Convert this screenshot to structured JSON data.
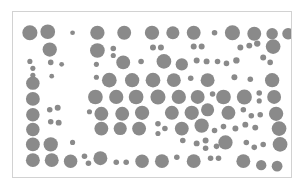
{
  "chart_data": {
    "type": "scatter",
    "title": "",
    "subtitle": "",
    "xlabel": "",
    "ylabel": "",
    "xlim": [
      0,
      280
    ],
    "ylim": [
      0,
      167
    ],
    "grid": false,
    "legend": null,
    "annotations": [],
    "xticklabels": [],
    "yticklabels": [],
    "marker": "circle",
    "marker_color": "#8a8a8a",
    "background_color": "#ffffff",
    "frame_color": "#d2d2d2",
    "size_encoding": "radius",
    "series": [
      {
        "name": "bubbles",
        "color": "#8a8a8a",
        "points": [
          {
            "x": 17,
            "y": 21,
            "r": 7.6
          },
          {
            "x": 35,
            "y": 20,
            "r": 7.4
          },
          {
            "x": 60,
            "y": 21,
            "r": 2.4
          },
          {
            "x": 85,
            "y": 21,
            "r": 7.2
          },
          {
            "x": 112,
            "y": 21,
            "r": 7.0
          },
          {
            "x": 140,
            "y": 21,
            "r": 7.2
          },
          {
            "x": 161,
            "y": 21,
            "r": 6.6
          },
          {
            "x": 182,
            "y": 21,
            "r": 7.0
          },
          {
            "x": 203,
            "y": 21,
            "r": 2.8
          },
          {
            "x": 221,
            "y": 21,
            "r": 7.6
          },
          {
            "x": 243,
            "y": 22,
            "r": 7.0
          },
          {
            "x": 261,
            "y": 22,
            "r": 5.8
          },
          {
            "x": 277,
            "y": 22,
            "r": 5.8
          },
          {
            "x": 37,
            "y": 38,
            "r": 7.2
          },
          {
            "x": 85,
            "y": 39,
            "r": 7.4
          },
          {
            "x": 101,
            "y": 37,
            "r": 2.8
          },
          {
            "x": 101,
            "y": 44,
            "r": 2.6
          },
          {
            "x": 141,
            "y": 36,
            "r": 3.0
          },
          {
            "x": 149,
            "y": 36,
            "r": 3.0
          },
          {
            "x": 182,
            "y": 35,
            "r": 3.0
          },
          {
            "x": 190,
            "y": 35,
            "r": 3.0
          },
          {
            "x": 229,
            "y": 36,
            "r": 3.0
          },
          {
            "x": 238,
            "y": 34,
            "r": 3.0
          },
          {
            "x": 246,
            "y": 32,
            "r": 3.2
          },
          {
            "x": 262,
            "y": 35,
            "r": 7.4
          },
          {
            "x": 17,
            "y": 50,
            "r": 2.6
          },
          {
            "x": 20,
            "y": 57,
            "r": 2.6
          },
          {
            "x": 20,
            "y": 64,
            "r": 2.6
          },
          {
            "x": 38,
            "y": 51,
            "r": 2.8
          },
          {
            "x": 49,
            "y": 53,
            "r": 2.4
          },
          {
            "x": 84,
            "y": 53,
            "r": 2.6
          },
          {
            "x": 111,
            "y": 51,
            "r": 7.0
          },
          {
            "x": 129,
            "y": 50,
            "r": 2.8
          },
          {
            "x": 152,
            "y": 50,
            "r": 7.4
          },
          {
            "x": 170,
            "y": 53,
            "r": 6.2
          },
          {
            "x": 185,
            "y": 49,
            "r": 3.0
          },
          {
            "x": 195,
            "y": 50,
            "r": 3.0
          },
          {
            "x": 206,
            "y": 50,
            "r": 2.8
          },
          {
            "x": 215,
            "y": 52,
            "r": 2.8
          },
          {
            "x": 225,
            "y": 49,
            "r": 3.2
          },
          {
            "x": 252,
            "y": 46,
            "r": 3.0
          },
          {
            "x": 259,
            "y": 51,
            "r": 2.8
          },
          {
            "x": 20,
            "y": 72,
            "r": 6.8
          },
          {
            "x": 39,
            "y": 65,
            "r": 2.4
          },
          {
            "x": 84,
            "y": 66,
            "r": 2.6
          },
          {
            "x": 97,
            "y": 69,
            "r": 7.4
          },
          {
            "x": 120,
            "y": 69,
            "r": 7.2
          },
          {
            "x": 141,
            "y": 69,
            "r": 7.4
          },
          {
            "x": 162,
            "y": 69,
            "r": 7.0
          },
          {
            "x": 179,
            "y": 67,
            "r": 2.8
          },
          {
            "x": 196,
            "y": 69,
            "r": 7.0
          },
          {
            "x": 223,
            "y": 66,
            "r": 3.0
          },
          {
            "x": 239,
            "y": 68,
            "r": 2.8
          },
          {
            "x": 261,
            "y": 69,
            "r": 7.2
          },
          {
            "x": 20,
            "y": 88,
            "r": 7.0
          },
          {
            "x": 83,
            "y": 86,
            "r": 7.4
          },
          {
            "x": 104,
            "y": 86,
            "r": 7.2
          },
          {
            "x": 124,
            "y": 86,
            "r": 7.4
          },
          {
            "x": 146,
            "y": 86,
            "r": 7.6
          },
          {
            "x": 167,
            "y": 86,
            "r": 7.2
          },
          {
            "x": 186,
            "y": 86,
            "r": 7.0
          },
          {
            "x": 201,
            "y": 83,
            "r": 2.8
          },
          {
            "x": 212,
            "y": 86,
            "r": 7.4
          },
          {
            "x": 233,
            "y": 86,
            "r": 7.6
          },
          {
            "x": 248,
            "y": 82,
            "r": 2.8
          },
          {
            "x": 248,
            "y": 90,
            "r": 2.6
          },
          {
            "x": 263,
            "y": 86,
            "r": 7.0
          },
          {
            "x": 20,
            "y": 104,
            "r": 6.8
          },
          {
            "x": 37,
            "y": 99,
            "r": 2.8
          },
          {
            "x": 45,
            "y": 97,
            "r": 3.0
          },
          {
            "x": 77,
            "y": 101,
            "r": 2.6
          },
          {
            "x": 89,
            "y": 103,
            "r": 7.0
          },
          {
            "x": 110,
            "y": 103,
            "r": 7.0
          },
          {
            "x": 130,
            "y": 102,
            "r": 7.2
          },
          {
            "x": 160,
            "y": 102,
            "r": 7.0
          },
          {
            "x": 180,
            "y": 102,
            "r": 7.2
          },
          {
            "x": 196,
            "y": 99,
            "r": 6.6
          },
          {
            "x": 217,
            "y": 102,
            "r": 7.0
          },
          {
            "x": 232,
            "y": 99,
            "r": 2.8
          },
          {
            "x": 240,
            "y": 105,
            "r": 2.8
          },
          {
            "x": 249,
            "y": 104,
            "r": 2.8
          },
          {
            "x": 265,
            "y": 103,
            "r": 7.2
          },
          {
            "x": 20,
            "y": 119,
            "r": 6.8
          },
          {
            "x": 38,
            "y": 111,
            "r": 2.8
          },
          {
            "x": 46,
            "y": 112,
            "r": 3.0
          },
          {
            "x": 89,
            "y": 118,
            "r": 7.0
          },
          {
            "x": 108,
            "y": 118,
            "r": 6.6
          },
          {
            "x": 127,
            "y": 118,
            "r": 7.0
          },
          {
            "x": 146,
            "y": 113,
            "r": 2.8
          },
          {
            "x": 153,
            "y": 118,
            "r": 2.8
          },
          {
            "x": 146,
            "y": 123,
            "r": 2.6
          },
          {
            "x": 170,
            "y": 118,
            "r": 7.0
          },
          {
            "x": 190,
            "y": 115,
            "r": 7.2
          },
          {
            "x": 203,
            "y": 120,
            "r": 2.8
          },
          {
            "x": 212,
            "y": 116,
            "r": 2.8
          },
          {
            "x": 224,
            "y": 118,
            "r": 3.0
          },
          {
            "x": 234,
            "y": 114,
            "r": 3.0
          },
          {
            "x": 244,
            "y": 117,
            "r": 3.0
          },
          {
            "x": 268,
            "y": 118,
            "r": 7.4
          },
          {
            "x": 20,
            "y": 134,
            "r": 7.0
          },
          {
            "x": 38,
            "y": 134,
            "r": 7.2
          },
          {
            "x": 60,
            "y": 132,
            "r": 2.6
          },
          {
            "x": 171,
            "y": 130,
            "r": 2.8
          },
          {
            "x": 185,
            "y": 133,
            "r": 3.0
          },
          {
            "x": 194,
            "y": 130,
            "r": 3.0
          },
          {
            "x": 194,
            "y": 138,
            "r": 2.8
          },
          {
            "x": 205,
            "y": 136,
            "r": 2.8
          },
          {
            "x": 214,
            "y": 132,
            "r": 7.2
          },
          {
            "x": 235,
            "y": 132,
            "r": 2.8
          },
          {
            "x": 243,
            "y": 137,
            "r": 2.8
          },
          {
            "x": 252,
            "y": 134,
            "r": 2.8
          },
          {
            "x": 269,
            "y": 134,
            "r": 7.4
          },
          {
            "x": 20,
            "y": 150,
            "r": 7.0
          },
          {
            "x": 39,
            "y": 150,
            "r": 7.0
          },
          {
            "x": 58,
            "y": 151,
            "r": 6.8
          },
          {
            "x": 72,
            "y": 146,
            "r": 2.8
          },
          {
            "x": 76,
            "y": 153,
            "r": 2.8
          },
          {
            "x": 88,
            "y": 148,
            "r": 7.0
          },
          {
            "x": 104,
            "y": 152,
            "r": 2.8
          },
          {
            "x": 114,
            "y": 152,
            "r": 2.8
          },
          {
            "x": 130,
            "y": 151,
            "r": 6.8
          },
          {
            "x": 150,
            "y": 151,
            "r": 7.0
          },
          {
            "x": 165,
            "y": 147,
            "r": 2.8
          },
          {
            "x": 182,
            "y": 151,
            "r": 7.0
          },
          {
            "x": 199,
            "y": 148,
            "r": 2.8
          },
          {
            "x": 207,
            "y": 148,
            "r": 2.8
          },
          {
            "x": 232,
            "y": 151,
            "r": 7.0
          },
          {
            "x": 250,
            "y": 155,
            "r": 5.2
          },
          {
            "x": 266,
            "y": 156,
            "r": 5.4
          }
        ]
      }
    ]
  }
}
